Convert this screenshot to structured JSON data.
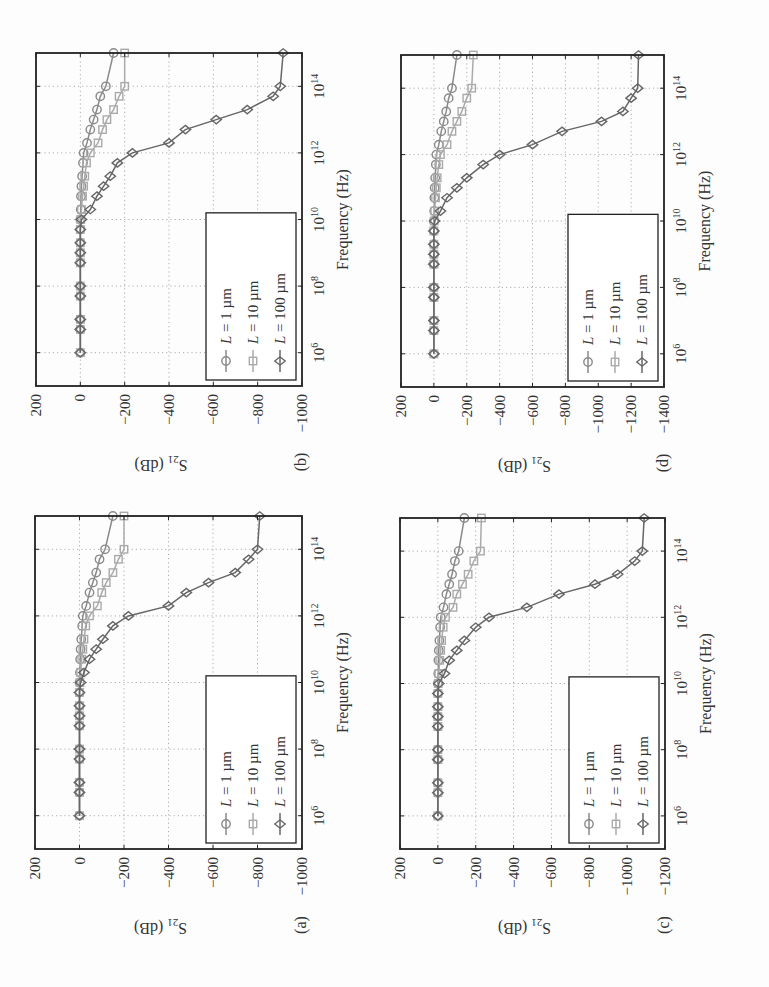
{
  "figure": {
    "orientation": "rotated 90 degrees counter-clockwise",
    "panels": [
      {
        "id": "a",
        "label": "(a)"
      },
      {
        "id": "b",
        "label": "(b)"
      },
      {
        "id": "c",
        "label": "(c)"
      },
      {
        "id": "d",
        "label": "(d)"
      }
    ]
  },
  "chart_data": [
    {
      "panel": "(a)",
      "type": "line",
      "xlabel": "Frequency (Hz)",
      "ylabel": "S21 (dB)",
      "xscale": "log",
      "xlim": [
        100000.0,
        1000000000000000.0
      ],
      "ylim": [
        -1000,
        200
      ],
      "xticks": [
        "10^6",
        "10^8",
        "10^10",
        "10^12",
        "10^14"
      ],
      "yticks": [
        200,
        0,
        -200,
        -400,
        -600,
        -800,
        -1000
      ],
      "grid": true,
      "legend_position": "lower left",
      "legend": [
        "L = 1 µm",
        "L = 10 µm",
        "L = 100 µm"
      ],
      "x_log10": [
        6,
        6.7,
        7,
        7.7,
        8,
        8.7,
        9,
        9.3,
        9.7,
        10,
        10.3,
        10.7,
        11,
        11.3,
        11.7,
        12,
        12.3,
        12.7,
        13,
        13.3,
        13.7,
        14,
        15
      ],
      "series": [
        {
          "name": "L = 1 µm",
          "marker": "circle",
          "color": "#8a8a8a",
          "values": [
            0,
            0,
            0,
            0,
            0,
            0,
            0,
            0,
            0,
            0,
            -2,
            -3,
            -5,
            -8,
            -12,
            -15,
            -30,
            -45,
            -60,
            -75,
            -90,
            -115,
            -150
          ]
        },
        {
          "name": "L = 10 µm",
          "marker": "square",
          "color": "#aaaaaa",
          "values": [
            0,
            0,
            0,
            0,
            0,
            0,
            0,
            0,
            0,
            -2,
            -5,
            -10,
            -15,
            -20,
            -28,
            -45,
            -80,
            -100,
            -120,
            -150,
            -175,
            -200,
            -200
          ]
        },
        {
          "name": "L = 100 µm",
          "marker": "diamond",
          "color": "#666666",
          "values": [
            0,
            0,
            0,
            0,
            0,
            0,
            0,
            0,
            0,
            -5,
            -20,
            -45,
            -75,
            -105,
            -150,
            -220,
            -400,
            -480,
            -580,
            -700,
            -760,
            -800,
            -810
          ]
        }
      ]
    },
    {
      "panel": "(b)",
      "type": "line",
      "xlabel": "Frequency (Hz)",
      "ylabel": "S21 (dB)",
      "xscale": "log",
      "xlim": [
        100000.0,
        1000000000000000.0
      ],
      "ylim": [
        -1000,
        200
      ],
      "xticks": [
        "10^6",
        "10^8",
        "10^10",
        "10^12",
        "10^14"
      ],
      "yticks": [
        200,
        0,
        -200,
        -400,
        -600,
        -800,
        -1000
      ],
      "grid": true,
      "legend_position": "lower left",
      "legend": [
        "L = 1 µm",
        "L = 10 µm",
        "L = 100 µm"
      ],
      "x_log10": [
        6,
        6.7,
        7,
        7.7,
        8,
        8.7,
        9,
        9.3,
        9.7,
        10,
        10.3,
        10.7,
        11,
        11.3,
        11.7,
        12,
        12.3,
        12.7,
        13,
        13.3,
        13.7,
        14,
        15
      ],
      "series": [
        {
          "name": "L = 1 µm",
          "marker": "circle",
          "color": "#8a8a8a",
          "values": [
            0,
            0,
            0,
            0,
            0,
            0,
            0,
            0,
            0,
            0,
            -2,
            -3,
            -5,
            -8,
            -12,
            -15,
            -30,
            -45,
            -60,
            -75,
            -90,
            -115,
            -150
          ]
        },
        {
          "name": "L = 10 µm",
          "marker": "square",
          "color": "#aaaaaa",
          "values": [
            0,
            0,
            0,
            0,
            0,
            0,
            0,
            0,
            0,
            -2,
            -5,
            -10,
            -15,
            -20,
            -28,
            -45,
            -80,
            -100,
            -120,
            -150,
            -175,
            -200,
            -200
          ]
        },
        {
          "name": "L = 100 µm",
          "marker": "diamond",
          "color": "#666666",
          "values": [
            0,
            0,
            0,
            0,
            0,
            0,
            0,
            0,
            0,
            -5,
            -45,
            -75,
            -105,
            -135,
            -167,
            -235,
            -400,
            -474,
            -613,
            -753,
            -870,
            -902,
            -915
          ]
        }
      ]
    },
    {
      "panel": "(c)",
      "type": "line",
      "xlabel": "Frequency (Hz)",
      "ylabel": "S21 (dB)",
      "xscale": "log",
      "xlim": [
        100000.0,
        1000000000000000.0
      ],
      "ylim": [
        -1200,
        200
      ],
      "xticks": [
        "10^6",
        "10^8",
        "10^10",
        "10^12",
        "10^14"
      ],
      "yticks": [
        200,
        0,
        -200,
        -400,
        -600,
        -800,
        -1000,
        -1200
      ],
      "grid": true,
      "legend_position": "lower left",
      "legend": [
        "L = 1 µm",
        "L = 10 µm",
        "L = 100 µm"
      ],
      "x_log10": [
        6,
        6.7,
        7,
        7.7,
        8,
        8.7,
        9,
        9.3,
        9.7,
        10,
        10.3,
        10.7,
        11,
        11.3,
        11.7,
        12,
        12.3,
        12.7,
        13,
        13.3,
        13.7,
        14,
        15
      ],
      "series": [
        {
          "name": "L = 1 µm",
          "marker": "circle",
          "color": "#8a8a8a",
          "values": [
            0,
            0,
            0,
            0,
            0,
            0,
            0,
            0,
            0,
            0,
            -2,
            -3,
            -5,
            -8,
            -12,
            -15,
            -30,
            -45,
            -60,
            -75,
            -90,
            -110,
            -140
          ]
        },
        {
          "name": "L = 10 µm",
          "marker": "square",
          "color": "#aaaaaa",
          "values": [
            0,
            0,
            0,
            0,
            0,
            0,
            0,
            0,
            0,
            -2,
            -5,
            -10,
            -15,
            -20,
            -28,
            -40,
            -80,
            -100,
            -130,
            -160,
            -190,
            -225,
            -230
          ]
        },
        {
          "name": "L = 100 µm",
          "marker": "diamond",
          "color": "#666666",
          "values": [
            0,
            0,
            0,
            0,
            0,
            0,
            0,
            0,
            0,
            -5,
            -35,
            -60,
            -100,
            -140,
            -200,
            -270,
            -470,
            -640,
            -830,
            -950,
            -1040,
            -1080,
            -1090
          ]
        }
      ]
    },
    {
      "panel": "(d)",
      "type": "line",
      "xlabel": "Frequency (Hz)",
      "ylabel": "S21 (dB)",
      "xscale": "log",
      "xlim": [
        100000.0,
        1000000000000000.0
      ],
      "ylim": [
        -1400,
        200
      ],
      "xticks": [
        "10^6",
        "10^8",
        "10^10",
        "10^12",
        "10^14"
      ],
      "yticks": [
        200,
        0,
        -200,
        -400,
        -600,
        -800,
        -1000,
        -1200,
        -1400
      ],
      "grid": true,
      "legend_position": "lower left",
      "legend": [
        "L = 1 µm",
        "L = 10 µm",
        "L = 100 µm"
      ],
      "x_log10": [
        6,
        6.7,
        7,
        7.7,
        8,
        8.7,
        9,
        9.3,
        9.7,
        10,
        10.3,
        10.7,
        11,
        11.3,
        11.7,
        12,
        12.3,
        12.7,
        13,
        13.3,
        13.7,
        14,
        15
      ],
      "series": [
        {
          "name": "L = 1 µm",
          "marker": "circle",
          "color": "#8a8a8a",
          "values": [
            0,
            0,
            0,
            0,
            0,
            0,
            0,
            0,
            0,
            0,
            -2,
            -3,
            -5,
            -8,
            -12,
            -15,
            -30,
            -45,
            -60,
            -75,
            -90,
            -110,
            -140
          ]
        },
        {
          "name": "L = 10 µm",
          "marker": "square",
          "color": "#aaaaaa",
          "values": [
            0,
            0,
            0,
            0,
            0,
            0,
            0,
            0,
            0,
            -2,
            -5,
            -10,
            -15,
            -20,
            -30,
            -40,
            -80,
            -110,
            -140,
            -170,
            -200,
            -230,
            -240
          ]
        },
        {
          "name": "L = 100 µm",
          "marker": "diamond",
          "color": "#666666",
          "values": [
            0,
            0,
            0,
            0,
            0,
            0,
            0,
            0,
            0,
            -5,
            -40,
            -80,
            -140,
            -200,
            -300,
            -400,
            -600,
            -780,
            -1020,
            -1150,
            -1200,
            -1240,
            -1245
          ]
        }
      ]
    }
  ]
}
